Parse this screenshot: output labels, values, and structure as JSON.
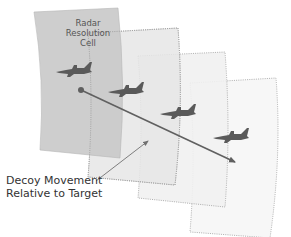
{
  "diagram": {
    "cell_label": [
      "Radar",
      "Resolution",
      "Cell"
    ],
    "decoy_label": [
      "Decoy Movement",
      "Relative to Target"
    ],
    "colors": {
      "cell_fill": "#c9c9c9",
      "cell_ghost_fill": "#ececec",
      "dotted_border": "#9a9a9a",
      "aircraft": "#5a5a5a",
      "arrow": "#606060",
      "text": "#333333"
    },
    "cells": [
      {
        "id": 1,
        "style": "solid"
      },
      {
        "id": 2,
        "style": "dotted"
      },
      {
        "id": 3,
        "style": "dotted"
      },
      {
        "id": 4,
        "style": "dotted"
      }
    ],
    "aircraft_count": 4
  }
}
